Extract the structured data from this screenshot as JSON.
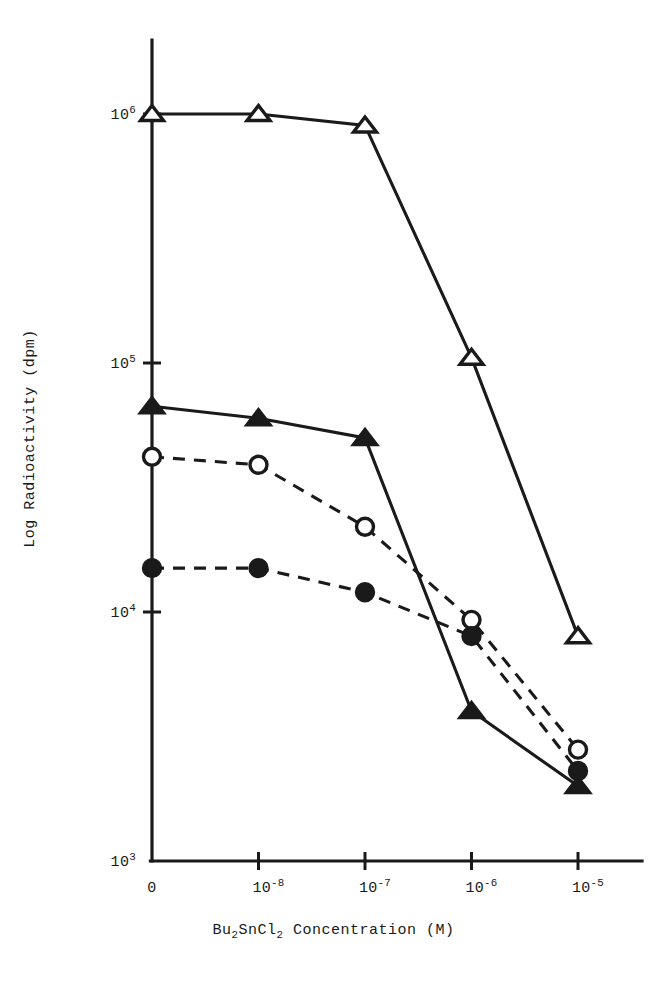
{
  "chart_data": {
    "type": "line",
    "title": "",
    "xlabel": "Bu2SnCl2 Concentration (M)",
    "xlabel_parts": {
      "prefix": "Bu",
      "sub1": "2",
      "mid": "SnCl",
      "sub2": "2",
      "suffix": " Concentration (M)"
    },
    "ylabel": "Log Radioactivity (dpm)",
    "x_scale": "log-categorical",
    "y_scale": "log",
    "ylim": [
      1000,
      2000000
    ],
    "grid": false,
    "legend": "none",
    "categories": [
      "0",
      "10^-8",
      "10^-7",
      "10^-6",
      "10^-5"
    ],
    "x_tick_labels": [
      {
        "mantissa": "0",
        "exponent": ""
      },
      {
        "mantissa": "10",
        "exponent": "-8"
      },
      {
        "mantissa": "10",
        "exponent": "-7"
      },
      {
        "mantissa": "10",
        "exponent": "-6"
      },
      {
        "mantissa": "10",
        "exponent": "-5"
      }
    ],
    "y_tick_labels": [
      {
        "mantissa": "10",
        "exponent": "6",
        "value": 1000000
      },
      {
        "mantissa": "10",
        "exponent": "5",
        "value": 100000
      },
      {
        "mantissa": "10",
        "exponent": "4",
        "value": 10000
      },
      {
        "mantissa": "10",
        "exponent": "3",
        "value": 1000
      }
    ],
    "series": [
      {
        "name": "open-triangle",
        "marker": "triangle-open",
        "line": "solid",
        "values": [
          1000000,
          1000000,
          900000,
          105000,
          8000
        ]
      },
      {
        "name": "filled-triangle",
        "marker": "triangle-filled",
        "line": "solid",
        "values": [
          67000,
          60000,
          50000,
          4000,
          2000
        ]
      },
      {
        "name": "open-circle",
        "marker": "circle-open",
        "line": "dashed",
        "values": [
          42000,
          39000,
          22000,
          9300,
          2800
        ]
      },
      {
        "name": "filled-circle",
        "marker": "circle-filled",
        "line": "dashed",
        "values": [
          15000,
          15000,
          12000,
          8000,
          2300
        ]
      }
    ],
    "colors": {
      "ink": "#1a1a1a",
      "background": "#ffffff"
    }
  }
}
